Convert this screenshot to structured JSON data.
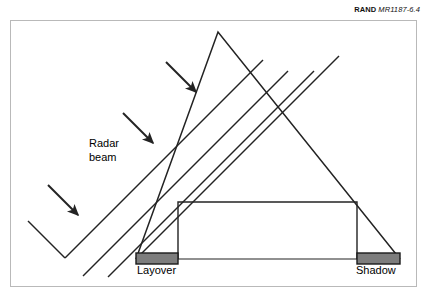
{
  "figure": {
    "credit_brand": "RAND",
    "credit_doc": "MR1187-6.4",
    "caption": "",
    "labels": {
      "radar_beam_line1": "Radar",
      "radar_beam_line2": "beam",
      "layover": "Layover",
      "shadow": "Shadow"
    },
    "colors": {
      "bar_fill": "#7d7d7d",
      "bar_stroke": "#1a1a1a",
      "line": "#232323",
      "frame": "#b9b9b9",
      "background": "#ffffff"
    },
    "geometry": {
      "frame": {
        "x": 10,
        "y": 20,
        "width": 407,
        "height": 267
      },
      "apex": {
        "x": 218,
        "y": 32
      },
      "ground_y": 259,
      "triangle_left_foot_x": 136,
      "triangle_right_foot_x": 400,
      "building": {
        "left": 178,
        "right": 357,
        "top": 202,
        "bottom": 259
      },
      "beam_angle_deg": 45,
      "beam_count": 4,
      "arrow_count": 3
    }
  }
}
